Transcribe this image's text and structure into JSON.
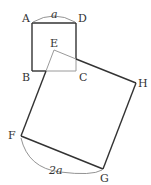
{
  "diagram": {
    "small_square": {
      "vertices": [
        "A",
        "B",
        "C",
        "D"
      ],
      "side_label": "a"
    },
    "large_square": {
      "vertices": [
        "E",
        "F",
        "G",
        "H"
      ],
      "side_label": "2a"
    },
    "labels": {
      "A": "A",
      "B": "B",
      "C": "C",
      "D": "D",
      "E": "E",
      "F": "F",
      "G": "G",
      "H": "H",
      "side_a": "a",
      "side_2a": "2a"
    },
    "colors": {
      "dark_line": "#333333",
      "light_line": "#9a9a9a"
    }
  }
}
